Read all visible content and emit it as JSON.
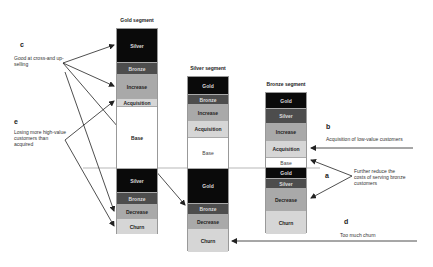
{
  "colors": {
    "black": "#0a0a0a",
    "dark": "#4d4d4d",
    "mid": "#a9a9a9",
    "light": "#d6d6d6",
    "white": "#ffffff",
    "line": "#222222"
  },
  "segments": [
    {
      "title": "Gold segment",
      "blocks": [
        {
          "label": "Silver",
          "tone": "black"
        },
        {
          "label": "Bronze",
          "tone": "dark"
        },
        {
          "label": "Increase",
          "tone": "mid"
        },
        {
          "label": "Acquisition",
          "tone": "light"
        },
        {
          "label": "Base",
          "tone": "white"
        },
        {
          "label": "Silver",
          "tone": "black"
        },
        {
          "label": "Bronze",
          "tone": "dark"
        },
        {
          "label": "Decrease",
          "tone": "mid"
        },
        {
          "label": "Churn",
          "tone": "light"
        }
      ]
    },
    {
      "title": "Silver segment",
      "blocks": [
        {
          "label": "Gold",
          "tone": "black"
        },
        {
          "label": "Bronze",
          "tone": "dark"
        },
        {
          "label": "Increase",
          "tone": "mid"
        },
        {
          "label": "Acquisition",
          "tone": "light"
        },
        {
          "label": "Base",
          "tone": "white"
        },
        {
          "label": "Gold",
          "tone": "black"
        },
        {
          "label": "Bronze",
          "tone": "dark"
        },
        {
          "label": "Decrease",
          "tone": "mid"
        },
        {
          "label": "Churn",
          "tone": "light"
        }
      ]
    },
    {
      "title": "Bronze segment",
      "blocks": [
        {
          "label": "Gold",
          "tone": "black"
        },
        {
          "label": "Silver",
          "tone": "dark"
        },
        {
          "label": "Increase",
          "tone": "mid"
        },
        {
          "label": "Acquisition",
          "tone": "light"
        },
        {
          "label": "Base",
          "tone": "white"
        },
        {
          "label": "Gold",
          "tone": "black"
        },
        {
          "label": "Silver",
          "tone": "dark"
        },
        {
          "label": "Decrease",
          "tone": "mid"
        },
        {
          "label": "Churn",
          "tone": "light"
        }
      ]
    }
  ],
  "annotations": {
    "a": {
      "letter": "a",
      "text": "Further reduce the costs of serving bronze customers"
    },
    "b": {
      "letter": "b",
      "text": "Acquisition of low-value customers"
    },
    "c": {
      "letter": "c",
      "text": "Good at cross-and up-selling"
    },
    "d": {
      "letter": "d",
      "text": "Too much churn"
    },
    "e": {
      "letter": "e",
      "text": "Losing more high-value customers than acquired"
    }
  }
}
